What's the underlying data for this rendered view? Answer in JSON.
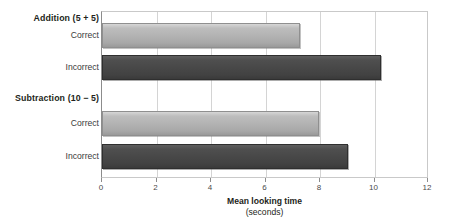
{
  "chart_data": {
    "type": "bar",
    "orientation": "horizontal",
    "title": "",
    "xlabel": "Mean looking time",
    "xlabel_unit": "(seconds)",
    "ylabel": "",
    "xlim": [
      0,
      12
    ],
    "xticks": [
      0,
      2,
      4,
      6,
      8,
      10,
      12
    ],
    "xtick_labels": [
      "0",
      "2",
      "4",
      "6",
      "8",
      "10",
      "12"
    ],
    "grid": "vertical",
    "legend": "none",
    "groups": [
      {
        "label": "Addition (5 + 5)",
        "bars": [
          {
            "label": "Correct",
            "value": 7.3,
            "color": "#b3b3b3"
          },
          {
            "label": "Incorrect",
            "value": 10.3,
            "color": "#484848"
          }
        ]
      },
      {
        "label": "Subtraction (10 − 5)",
        "bars": [
          {
            "label": "Correct",
            "value": 8.0,
            "color": "#b3b3b3"
          },
          {
            "label": "Incorrect",
            "value": 9.1,
            "color": "#484848"
          }
        ]
      }
    ],
    "categories": [
      "Addition (5 + 5) — Correct",
      "Addition (5 + 5) — Incorrect",
      "Subtraction (10 − 5) — Correct",
      "Subtraction (10 − 5) — Incorrect"
    ],
    "values": [
      7.3,
      10.3,
      8.0,
      9.1
    ],
    "colors": {
      "correct_bar": "#b3b3b3",
      "incorrect_bar": "#484848",
      "gridline": "#d4d4d4",
      "axis": "#8c8c8c",
      "text": "#231f20",
      "background": "#ffffff"
    }
  },
  "labels": {
    "group_addition": "Addition (5 + 5)",
    "group_subtraction": "Subtraction (10 − 5)",
    "addition_correct": "Correct",
    "addition_incorrect": "Incorrect",
    "subtraction_correct": "Correct",
    "subtraction_incorrect": "Incorrect"
  },
  "axis": {
    "title_main": "Mean looking time",
    "title_unit": "(seconds)",
    "ticks": [
      "0",
      "2",
      "4",
      "6",
      "8",
      "10",
      "12"
    ]
  }
}
